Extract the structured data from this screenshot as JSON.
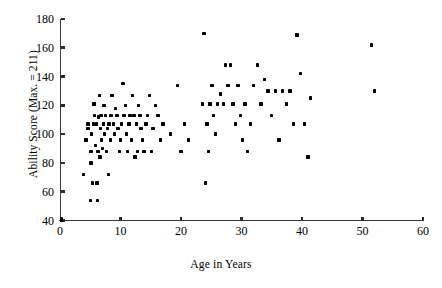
{
  "chart_data": {
    "type": "scatter",
    "title": "",
    "xlabel": "Age in Years",
    "ylabel": "Ability Score (Max. = 211)",
    "xlim": [
      0,
      60
    ],
    "ylim": [
      40,
      180
    ],
    "xticks": [
      0,
      10,
      20,
      30,
      40,
      50,
      60
    ],
    "yticks": [
      40,
      60,
      80,
      100,
      120,
      140,
      160,
      180
    ],
    "grid": false,
    "legend": null,
    "marker": "square",
    "marker_color": "#000000",
    "points": [
      [
        0.2,
        41
      ],
      [
        0.2,
        40
      ],
      [
        3.9,
        72
      ],
      [
        4.3,
        96
      ],
      [
        4.6,
        104
      ],
      [
        4.6,
        107
      ],
      [
        5.0,
        54
      ],
      [
        5.1,
        80
      ],
      [
        5.1,
        88
      ],
      [
        5.2,
        100
      ],
      [
        5.4,
        66
      ],
      [
        5.5,
        107
      ],
      [
        5.6,
        121
      ],
      [
        5.7,
        113
      ],
      [
        5.9,
        92
      ],
      [
        6.0,
        107
      ],
      [
        6.1,
        66
      ],
      [
        6.2,
        54
      ],
      [
        6.3,
        88
      ],
      [
        6.4,
        112
      ],
      [
        6.5,
        127
      ],
      [
        6.6,
        84
      ],
      [
        6.7,
        104
      ],
      [
        6.8,
        113
      ],
      [
        6.9,
        96
      ],
      [
        7.0,
        90
      ],
      [
        7.2,
        107
      ],
      [
        7.3,
        120
      ],
      [
        7.4,
        100
      ],
      [
        7.5,
        113
      ],
      [
        7.7,
        88
      ],
      [
        7.9,
        104
      ],
      [
        8.0,
        72
      ],
      [
        8.1,
        107
      ],
      [
        8.3,
        96
      ],
      [
        8.4,
        113
      ],
      [
        8.6,
        127
      ],
      [
        8.8,
        107
      ],
      [
        9.0,
        100
      ],
      [
        9.2,
        118
      ],
      [
        9.4,
        113
      ],
      [
        9.6,
        104
      ],
      [
        9.8,
        88
      ],
      [
        10.0,
        96
      ],
      [
        10.2,
        107
      ],
      [
        10.4,
        135
      ],
      [
        10.6,
        113
      ],
      [
        10.8,
        120
      ],
      [
        11.0,
        100
      ],
      [
        11.2,
        88
      ],
      [
        11.4,
        107
      ],
      [
        11.6,
        113
      ],
      [
        11.8,
        96
      ],
      [
        12.0,
        127
      ],
      [
        12.2,
        113
      ],
      [
        12.4,
        84
      ],
      [
        12.6,
        107
      ],
      [
        12.8,
        88
      ],
      [
        13.0,
        120
      ],
      [
        13.2,
        113
      ],
      [
        13.4,
        104
      ],
      [
        13.6,
        96
      ],
      [
        13.9,
        88
      ],
      [
        14.2,
        107
      ],
      [
        14.5,
        113
      ],
      [
        14.8,
        127
      ],
      [
        15.1,
        88
      ],
      [
        15.4,
        104
      ],
      [
        15.8,
        120
      ],
      [
        16.2,
        113
      ],
      [
        16.6,
        96
      ],
      [
        17.0,
        107
      ],
      [
        18.3,
        100
      ],
      [
        19.4,
        134
      ],
      [
        20.0,
        88
      ],
      [
        20.6,
        107
      ],
      [
        21.2,
        96
      ],
      [
        23.6,
        121
      ],
      [
        23.8,
        170
      ],
      [
        24.1,
        66
      ],
      [
        24.3,
        107
      ],
      [
        24.5,
        88
      ],
      [
        24.8,
        121
      ],
      [
        25.1,
        134
      ],
      [
        25.4,
        113
      ],
      [
        25.7,
        100
      ],
      [
        26.0,
        121
      ],
      [
        26.5,
        128
      ],
      [
        27.0,
        121
      ],
      [
        27.4,
        148
      ],
      [
        27.8,
        134
      ],
      [
        28.2,
        148
      ],
      [
        28.6,
        121
      ],
      [
        29.0,
        107
      ],
      [
        29.4,
        134
      ],
      [
        29.8,
        113
      ],
      [
        30.2,
        96
      ],
      [
        30.6,
        121
      ],
      [
        31.0,
        88
      ],
      [
        31.5,
        107
      ],
      [
        32.0,
        134
      ],
      [
        32.6,
        148
      ],
      [
        33.2,
        121
      ],
      [
        33.8,
        138
      ],
      [
        34.4,
        130
      ],
      [
        35.0,
        113
      ],
      [
        35.6,
        130
      ],
      [
        36.2,
        96
      ],
      [
        36.8,
        130
      ],
      [
        37.4,
        121
      ],
      [
        38.0,
        130
      ],
      [
        38.6,
        107
      ],
      [
        39.2,
        169
      ],
      [
        39.8,
        142
      ],
      [
        40.4,
        107
      ],
      [
        41.0,
        84
      ],
      [
        41.4,
        125
      ],
      [
        51.5,
        162
      ],
      [
        52.0,
        130
      ]
    ]
  },
  "axes": {
    "x_tick_labels": [
      "0",
      "10",
      "20",
      "30",
      "40",
      "50",
      "60"
    ],
    "y_tick_labels": [
      "40",
      "60",
      "80",
      "100",
      "120",
      "140",
      "160",
      "180"
    ]
  }
}
